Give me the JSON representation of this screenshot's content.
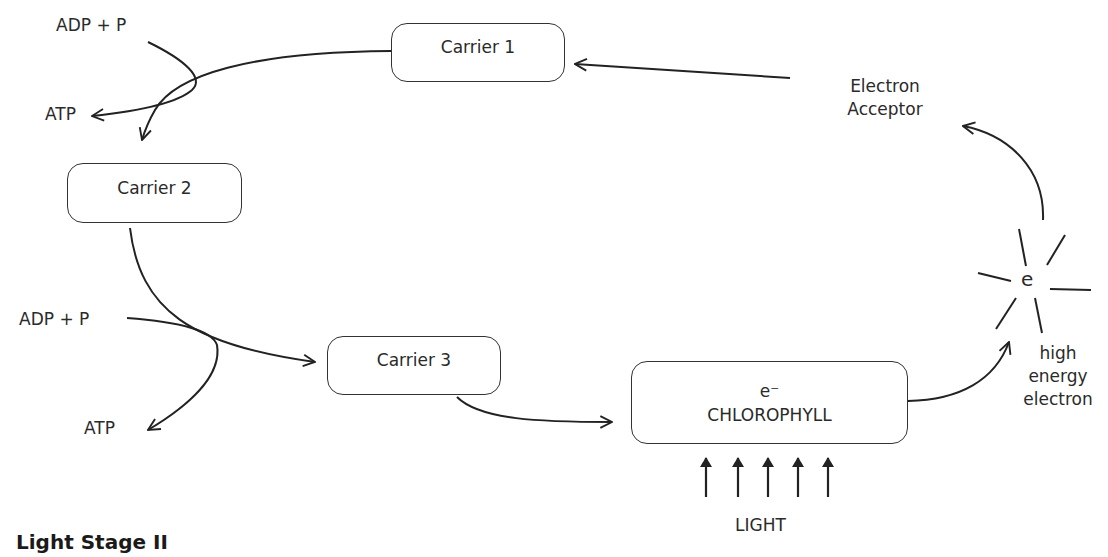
{
  "title": "Light Stage II",
  "carriers": [
    {
      "label": "Carrier 1"
    },
    {
      "label": "Carrier 2"
    },
    {
      "label": "Carrier 3"
    }
  ],
  "chlorophyll": {
    "electron": "e⁻",
    "label": "CHLOROPHYLL"
  },
  "electron_acceptor": {
    "line1": "Electron",
    "line2": "Acceptor"
  },
  "excited_electron": {
    "symbol": "e",
    "line1": "high",
    "line2": "energy",
    "line3": "electron"
  },
  "light": {
    "label": "LIGHT",
    "arrow_count": 5
  },
  "phosphorylation": [
    {
      "input": "ADP + P",
      "output": "ATP"
    },
    {
      "input": "ADP + P",
      "output": "ATP"
    }
  ],
  "colors": {
    "stroke": "#222222",
    "background": "#ffffff"
  }
}
